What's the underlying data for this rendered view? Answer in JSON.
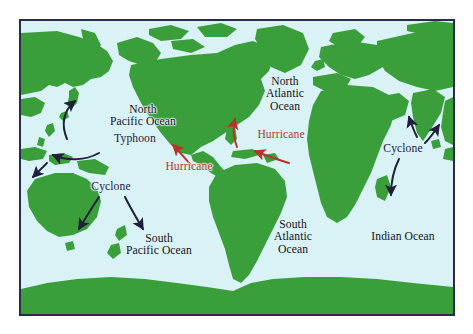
{
  "figure": {
    "type": "map",
    "projection": "pacific-centered world map",
    "colors": {
      "ocean": "#d9f2f5",
      "land": "#3a9e3a",
      "border": "#2a2a4a",
      "page_background": "#ffffff",
      "label_text": "#111118",
      "arrow_navy": "#20203c",
      "arrow_red": "#b6342a",
      "storm_label_red": "#b6342a"
    }
  },
  "ocean_labels": [
    {
      "id": "north-pacific-ocean",
      "text": "North\nPacific Ocean"
    },
    {
      "id": "north-atlantic-ocean",
      "text": "North\nAtlantic\nOcean"
    },
    {
      "id": "south-pacific-ocean",
      "text": "South\nPacific Ocean"
    },
    {
      "id": "south-atlantic-ocean",
      "text": "South\nAtlantic\nOcean"
    },
    {
      "id": "indian-ocean",
      "text": "Indian Ocean"
    }
  ],
  "storm_labels": [
    {
      "id": "typhoon-north-pacific",
      "text": "Typhoon",
      "color": "navy"
    },
    {
      "id": "hurricane-east-pacific",
      "text": "Hurricane",
      "color": "red"
    },
    {
      "id": "hurricane-north-atlantic",
      "text": "Hurricane",
      "color": "red"
    },
    {
      "id": "cyclone-south-pacific",
      "text": "Cyclone",
      "color": "navy"
    },
    {
      "id": "cyclone-indian-ocean",
      "text": "Cyclone",
      "color": "navy"
    }
  ]
}
